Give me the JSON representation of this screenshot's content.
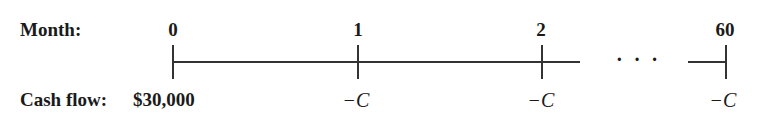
{
  "timeline": {
    "row_labels": {
      "month": "Month:",
      "cash_flow": "Cash flow:"
    },
    "periods": [
      {
        "month": "0",
        "cash_flow": "$30,000"
      },
      {
        "month": "1",
        "cash_flow": "−C"
      },
      {
        "month": "2",
        "cash_flow": "−C"
      },
      {
        "month": "60",
        "cash_flow": "−C"
      }
    ],
    "ellipsis": "· · ·"
  }
}
